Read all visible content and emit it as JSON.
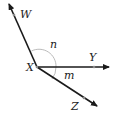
{
  "diagram": {
    "title": "",
    "vertex": {
      "label": "X",
      "x": 37,
      "y": 67
    },
    "rays": [
      {
        "name": "XW",
        "point_label": "W",
        "end": [
          8,
          2
        ],
        "dot": [
          14,
          15
        ],
        "label_pos": [
          20,
          18
        ]
      },
      {
        "name": "XY",
        "point_label": "Y",
        "end": [
          110,
          67
        ],
        "dot": [
          94,
          67
        ],
        "label_pos": [
          89,
          61
        ]
      },
      {
        "name": "XZ",
        "point_label": "Z",
        "end": [
          98,
          107
        ],
        "dot": [
          84,
          98
        ],
        "label_pos": [
          71,
          110
        ]
      }
    ],
    "angles": [
      {
        "label": "n",
        "between": [
          "XW",
          "XY"
        ],
        "label_pos": [
          50,
          48
        ]
      },
      {
        "label": "m",
        "between": [
          "XY",
          "XZ"
        ],
        "label_pos": [
          64,
          79
        ]
      }
    ],
    "colors": {
      "line": "#1a1a1a",
      "arc": "#aaaaaa",
      "dot": "#888888"
    }
  }
}
